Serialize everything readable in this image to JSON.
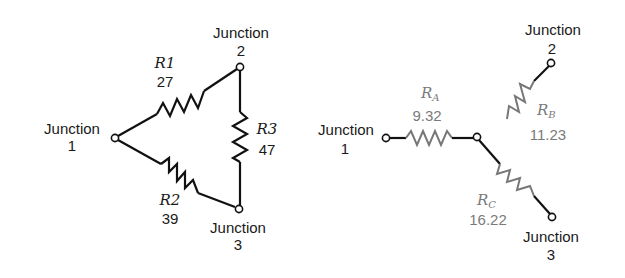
{
  "delta": {
    "junctions": [
      {
        "label": "Junction",
        "number": "1"
      },
      {
        "label": "Junction",
        "number": "2"
      },
      {
        "label": "Junction",
        "number": "3"
      }
    ],
    "resistors": [
      {
        "name": "R1",
        "value": "27",
        "between": "1-2"
      },
      {
        "name": "R2",
        "value": "39",
        "between": "1-3"
      },
      {
        "name": "R3",
        "value": "47",
        "between": "2-3"
      }
    ]
  },
  "wye": {
    "junctions": [
      {
        "label": "Junction",
        "number": "1"
      },
      {
        "label": "Junction",
        "number": "2"
      },
      {
        "label": "Junction",
        "number": "3"
      }
    ],
    "resistors": [
      {
        "name": "R",
        "sub": "A",
        "value": "9.32",
        "junction": "1"
      },
      {
        "name": "R",
        "sub": "B",
        "value": "11.23",
        "junction": "2"
      },
      {
        "name": "R",
        "sub": "C",
        "value": "16.22",
        "junction": "3"
      }
    ]
  },
  "colors": {
    "wire": "#111111",
    "wye_label": "#7a7a7a"
  }
}
